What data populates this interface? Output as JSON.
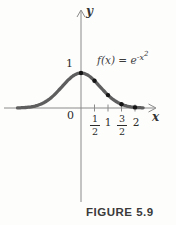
{
  "figure": {
    "caption": "FIGURE 5.9",
    "formula": {
      "lhs": "f(x) = e",
      "exponent_base": "-x",
      "exponent_power": "2"
    }
  },
  "axis_labels": {
    "x": "x",
    "y": "y",
    "origin": "0",
    "peak_y": "1"
  },
  "tick_labels": {
    "half": {
      "num": "1",
      "den": "2"
    },
    "one": "1",
    "three_halves": {
      "num": "3",
      "den": "2"
    },
    "two": "2"
  },
  "chart_data": {
    "type": "line",
    "xlabel": "x",
    "ylabel": "y",
    "function": "f(x) = exp(-x^2)",
    "x_range": [
      -2.35,
      2.3
    ],
    "ylim": [
      0,
      1.1
    ],
    "x_ticks": [
      0.5,
      1,
      1.5,
      2
    ],
    "x_tick_labels": [
      "1/2",
      "1",
      "3/2",
      "2"
    ],
    "y_value_labels": [
      "1"
    ],
    "origin_label": "0",
    "marked_points": [
      [
        0,
        1
      ],
      [
        0.5,
        0.7788
      ],
      [
        1,
        0.3679
      ],
      [
        1.5,
        0.1054
      ],
      [
        2,
        0.0183
      ]
    ],
    "grid": false,
    "legend": "none",
    "curve_color": "#5e5e5e",
    "axis_color": "#8a8a8a",
    "point_color": "#151515"
  }
}
